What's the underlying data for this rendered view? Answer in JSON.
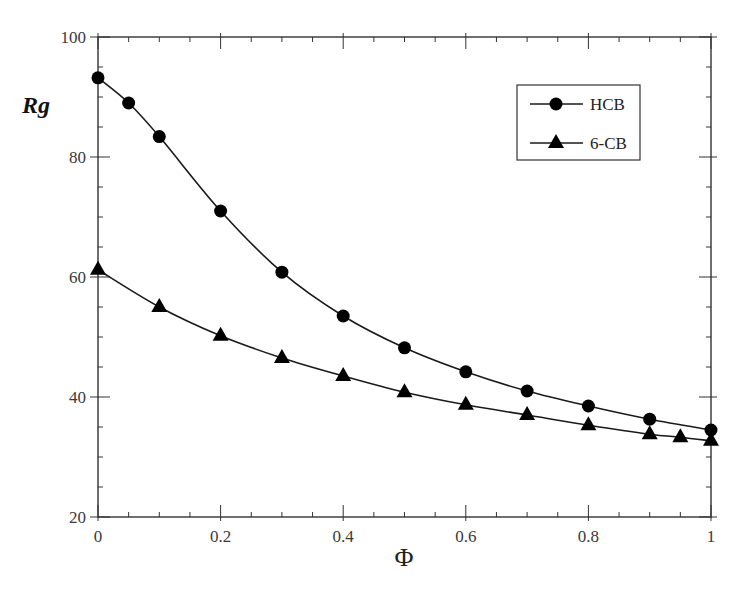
{
  "chart_data": {
    "type": "line",
    "title": "",
    "xlabel": "Φ",
    "ylabel": "Rg",
    "xlim": [
      0,
      1
    ],
    "ylim": [
      20,
      100
    ],
    "x_ticks": [
      0,
      0.2,
      0.4,
      0.6,
      0.8,
      1
    ],
    "x_tick_labels": [
      "0",
      "0.2",
      "0.4",
      "0.6",
      "0.8",
      "1"
    ],
    "y_ticks": [
      20,
      40,
      60,
      80,
      100
    ],
    "y_tick_labels": [
      "20",
      "40",
      "60",
      "80",
      "100"
    ],
    "grid": false,
    "legend_position": "upper right (inside)",
    "series": [
      {
        "name": "HCB",
        "marker": "circle",
        "x": [
          0,
          0.05,
          0.1,
          0.2,
          0.3,
          0.4,
          0.5,
          0.6,
          0.7,
          0.8,
          0.9,
          1.0
        ],
        "values": [
          93.2,
          89.0,
          83.4,
          71.0,
          60.8,
          53.5,
          48.2,
          44.2,
          41.0,
          38.5,
          36.3,
          34.5
        ]
      },
      {
        "name": "6-CB",
        "marker": "triangle",
        "x": [
          0,
          0.1,
          0.2,
          0.3,
          0.4,
          0.5,
          0.6,
          0.7,
          0.8,
          0.9,
          0.95,
          1.0
        ],
        "values": [
          61.2,
          55.0,
          50.2,
          46.5,
          43.5,
          40.8,
          38.7,
          37.0,
          35.3,
          33.8,
          33.3,
          32.7
        ]
      }
    ]
  },
  "colors": {
    "line": "#1a1a1a",
    "marker": "#000000",
    "axis": "#333333",
    "background": "#ffffff"
  }
}
